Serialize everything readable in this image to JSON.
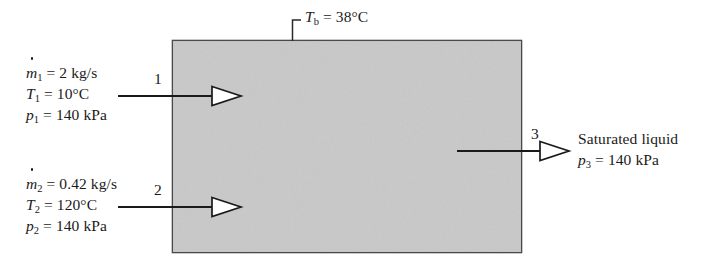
{
  "figure": {
    "control_volume": {
      "fill_color": "#c9c9c9",
      "border_color": "#4a4a4a"
    },
    "boundary_label": {
      "variable": "T",
      "subscript": "b",
      "equals": " = ",
      "value": "38°C",
      "full_text": "Tb = 38°C"
    },
    "inlet_1": {
      "stream_number": "1",
      "lines": [
        {
          "symbol": "m",
          "subscript": "1",
          "dotted": true,
          "equals": " = ",
          "value": "2 kg/s"
        },
        {
          "symbol": "T",
          "subscript": "1",
          "dotted": false,
          "equals": " = ",
          "value": "10°C"
        },
        {
          "symbol": "p",
          "subscript": "1",
          "dotted": false,
          "equals": " = ",
          "value": "140 kPa"
        }
      ]
    },
    "inlet_2": {
      "stream_number": "2",
      "lines": [
        {
          "symbol": "m",
          "subscript": "2",
          "dotted": true,
          "equals": " = ",
          "value": "0.42 kg/s"
        },
        {
          "symbol": "T",
          "subscript": "2",
          "dotted": false,
          "equals": " = ",
          "value": "120°C"
        },
        {
          "symbol": "p",
          "subscript": "2",
          "dotted": false,
          "equals": " = ",
          "value": "140 kPa"
        }
      ]
    },
    "outlet_3": {
      "stream_number": "3",
      "description": "Saturated liquid",
      "lines": [
        {
          "symbol": "p",
          "subscript": "3",
          "dotted": false,
          "equals": " = ",
          "value": "140 kPa"
        }
      ]
    }
  }
}
